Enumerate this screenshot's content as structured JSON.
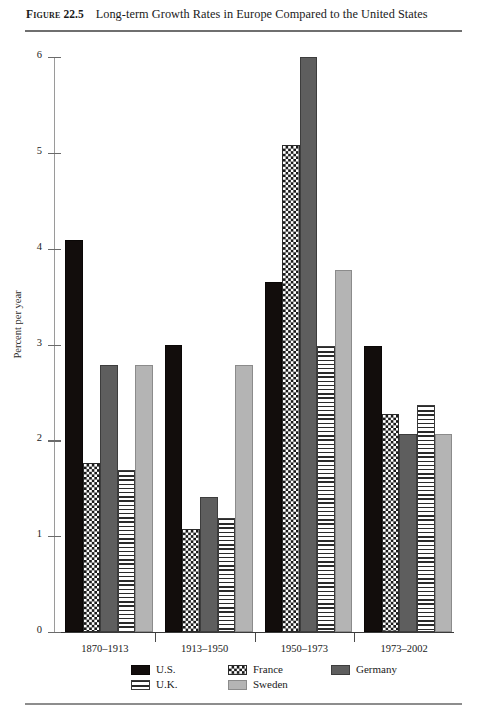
{
  "figure": {
    "label": "Figure",
    "number": "22.5",
    "title": "Long-term Growth Rates in Europe Compared to the United States"
  },
  "chart_data": {
    "type": "bar",
    "title": "Long-term Growth Rates in Europe Compared to the United States",
    "xlabel": "",
    "ylabel": "Percent per year",
    "ylim": [
      0,
      6
    ],
    "yticks": [
      "0",
      "1",
      "2",
      "3",
      "4",
      "5",
      "6"
    ],
    "grid": false,
    "legend_position": "bottom",
    "categories": [
      "1870–1913",
      "1913–1950",
      "1950–1973",
      "1973–2002"
    ],
    "series": [
      {
        "name": "U.S.",
        "color": "#120d0c",
        "pattern": "solid-black",
        "values": [
          4.09,
          3.0,
          3.65,
          2.98
        ]
      },
      {
        "name": "France",
        "color": "#1a1a1a",
        "pattern": "checkered-dots",
        "values": [
          1.76,
          1.08,
          5.08,
          2.28
        ]
      },
      {
        "name": "Germany",
        "color": "#5e5e5e",
        "pattern": "solid-dark-gray",
        "values": [
          2.79,
          1.41,
          6.0,
          2.07
        ]
      },
      {
        "name": "U.K.",
        "color": "#2a2a2a",
        "pattern": "horizontal-stripes",
        "values": [
          1.69,
          1.19,
          2.98,
          2.37
        ]
      },
      {
        "name": "Sweden",
        "color": "#b4b4b4",
        "pattern": "solid-light-gray",
        "values": [
          2.79,
          2.79,
          3.78,
          2.07
        ]
      }
    ]
  },
  "legend": {
    "entries": [
      {
        "label": "U.S.",
        "swatch": "swatch-us"
      },
      {
        "label": "U.K.",
        "swatch": "swatch-uk"
      },
      {
        "label": "France",
        "swatch": "swatch-france"
      },
      {
        "label": "Sweden",
        "swatch": "swatch-sweden"
      },
      {
        "label": "Germany",
        "swatch": "swatch-germany"
      }
    ]
  }
}
